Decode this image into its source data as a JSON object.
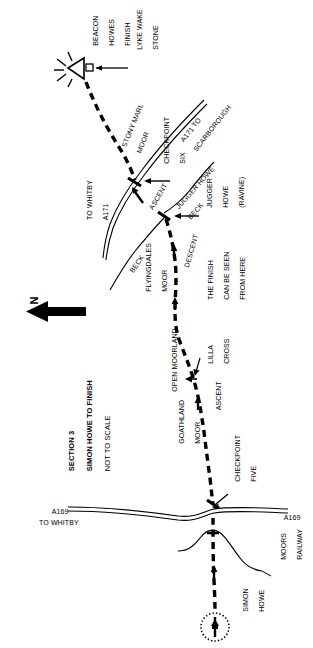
{
  "map": {
    "title_lines": [
      "SECTION 3",
      "SIMON HOWE TO FINISH",
      "NOT TO SCALE"
    ],
    "section_label": "SECTION 3",
    "route_label": "SIMON HOWE TO FINISH",
    "scale_note": "NOT TO SCALE",
    "north_letter": "N",
    "colors": {
      "ink": "#000000",
      "paper": "#ffffff"
    },
    "labels": [
      {
        "name": "beacon-howes-finish",
        "text": "BEACON\nHOWES\nFINISH"
      },
      {
        "name": "lyke-wake-stone",
        "text": "LYKE WAKE\nSTONE"
      },
      {
        "name": "stony-marl-moor",
        "text": "STONY MARL\nMOOR"
      },
      {
        "name": "a171-to-scarborough",
        "text": "A171 TO\nSCARBOROUGH"
      },
      {
        "name": "checkpoint-six",
        "text": "CHECKPOINT\nSIX"
      },
      {
        "name": "ascent-upper",
        "text": "ASCENT"
      },
      {
        "name": "jugger-howe-beck",
        "text": "JUGGER HOWE\nBECK"
      },
      {
        "name": "jugger-howe-ravine",
        "text": "JUGGER\nHOWE\n(RAVINE)"
      },
      {
        "name": "descent",
        "text": "DESCENT"
      },
      {
        "name": "to-whitby-a171",
        "text": "TO WHITBY\nA171"
      },
      {
        "name": "beck",
        "text": "BECK"
      },
      {
        "name": "flyingdales-moor",
        "text": "FLYINGDALES\nMOOR"
      },
      {
        "name": "finish-can-be-seen",
        "text": "THE FINISH\nCAN BE SEEN\nFROM HERE"
      },
      {
        "name": "lilla-cross",
        "text": "LILLA\nCROSS"
      },
      {
        "name": "open-moorland",
        "text": "OPEN MOORLAND"
      },
      {
        "name": "ascent-lower",
        "text": "ASCENT"
      },
      {
        "name": "goathland-moor",
        "text": "GOATHLAND\nMOOR"
      },
      {
        "name": "checkpoint-five",
        "text": "CHECKPOINT\nFIVE"
      },
      {
        "name": "a169-left",
        "text": "A169"
      },
      {
        "name": "to-whitby",
        "text": "TO WHITBY"
      },
      {
        "name": "a169-right",
        "text": "A169"
      },
      {
        "name": "moors-railway",
        "text": "MOORS\nRAILWAY"
      },
      {
        "name": "simon-howe",
        "text": "SIMON\nHOWE"
      }
    ],
    "text": {
      "beacon_howes_l1": "BEACON",
      "beacon_howes_l2": "HOWES",
      "beacon_howes_l3": "FINISH",
      "lyke_wake_l1": "LYKE WAKE",
      "lyke_wake_l2": "STONE",
      "stony_marl_l1": "STONY MARL",
      "stony_marl_l2": "MOOR",
      "a171_scarb_l1": "A171 TO",
      "a171_scarb_l2": "SCARBOROUGH",
      "checkpoint_six_l1": "CHECKPOINT",
      "checkpoint_six_l2": "SIX",
      "ascent_upper": "ASCENT",
      "jugger_beck_l1": "JUGGER HOWE",
      "jugger_beck_l2": "BECK",
      "jugger_ravine_l1": "JUGGER",
      "jugger_ravine_l2": "HOWE",
      "jugger_ravine_l3": "(RAVINE)",
      "descent": "DESCENT",
      "to_whitby_a171_l1": "TO WHITBY",
      "to_whitby_a171_l2": "A171",
      "beck": "BECK",
      "flyingdales_l1": "FLYINGDALES",
      "flyingdales_l2": "MOOR",
      "finish_seen_l1": "THE FINISH",
      "finish_seen_l2": "CAN BE SEEN",
      "finish_seen_l3": "FROM HERE",
      "lilla_l1": "LILLA",
      "lilla_l2": "CROSS",
      "open_moorland": "OPEN MOORLAND",
      "ascent_lower": "ASCENT",
      "goathland_l1": "GOATHLAND",
      "goathland_l2": "MOOR",
      "checkpoint_five_l1": "CHECKPOINT",
      "checkpoint_five_l2": "FIVE",
      "a169_left": "A169",
      "to_whitby": "TO WHITBY",
      "a169_right": "A169",
      "moors_railway_l1": "MOORS",
      "moors_railway_l2": "RAILWAY",
      "simon_howe_l1": "SIMON",
      "simon_howe_l2": "HOWE"
    }
  }
}
